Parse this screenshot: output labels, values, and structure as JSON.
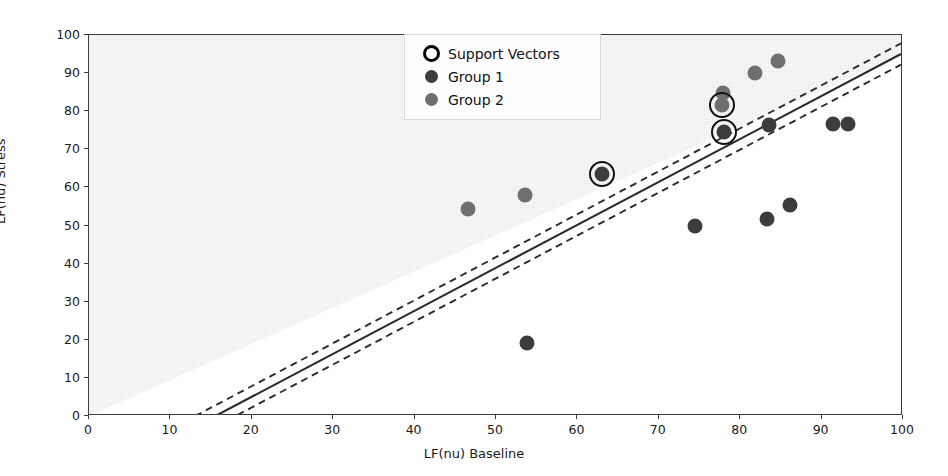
{
  "chart_data": {
    "type": "scatter",
    "title": "",
    "xlabel": "LF(nu) Baseline",
    "ylabel": "LF(nu) Stress",
    "xlim": [
      0,
      100
    ],
    "ylim": [
      0,
      100
    ],
    "xticks": [
      0,
      10,
      20,
      30,
      40,
      50,
      60,
      70,
      80,
      90,
      100
    ],
    "yticks": [
      0,
      10,
      20,
      30,
      40,
      50,
      60,
      70,
      80,
      90,
      100
    ],
    "grid": false,
    "legend_position": "upper center",
    "series": [
      {
        "name": "Group 1",
        "color": "#3c3c3c",
        "points": [
          {
            "x": 53.8,
            "y": 19.2
          },
          {
            "x": 74.4,
            "y": 49.8
          },
          {
            "x": 78.0,
            "y": 74.6
          },
          {
            "x": 83.3,
            "y": 51.6
          },
          {
            "x": 83.5,
            "y": 76.3
          },
          {
            "x": 86.1,
            "y": 55.4
          },
          {
            "x": 91.4,
            "y": 76.6
          },
          {
            "x": 93.2,
            "y": 76.6
          },
          {
            "x": 63.0,
            "y": 63.4
          }
        ]
      },
      {
        "name": "Group 2",
        "color": "#6f6f6f",
        "points": [
          {
            "x": 46.6,
            "y": 54.2
          },
          {
            "x": 53.6,
            "y": 58.0
          },
          {
            "x": 77.9,
            "y": 84.9
          },
          {
            "x": 81.8,
            "y": 89.9
          },
          {
            "x": 84.6,
            "y": 93.2
          },
          {
            "x": 77.8,
            "y": 81.5
          }
        ]
      },
      {
        "name": "Support Vectors",
        "color": "#111111",
        "points": [
          {
            "x": 63.0,
            "y": 63.4
          },
          {
            "x": 77.8,
            "y": 81.5
          },
          {
            "x": 78.0,
            "y": 74.6
          }
        ]
      }
    ],
    "decision_boundary": {
      "style": "solid",
      "slope": 1.128,
      "intercept": -17.8,
      "color": "#2b2b2b"
    },
    "margins": [
      {
        "style": "dashed",
        "slope": 1.128,
        "intercept": -15.0,
        "color": "#2b2b2b"
      },
      {
        "style": "dashed",
        "slope": 1.128,
        "intercept": -20.6,
        "color": "#2b2b2b"
      }
    ],
    "shaded_region": {
      "side": "above",
      "color": "#e8e8e8",
      "texture": "dither"
    }
  },
  "legend": {
    "items": [
      {
        "label": "Support Vectors",
        "marker": "open-circle"
      },
      {
        "label": "Group 1",
        "marker": "filled-circle"
      },
      {
        "label": "Group 2",
        "marker": "filled-circle"
      }
    ]
  }
}
